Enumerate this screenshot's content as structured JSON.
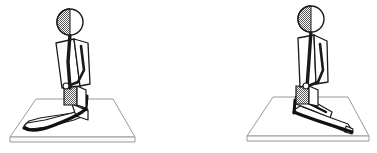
{
  "figure": {
    "background_color": "#ffffff",
    "ink_color": "#1a1a1a",
    "platform_line_color": "#808080",
    "shade_color": "#7a7a7a",
    "width": 377,
    "height": 153,
    "artifacts": {
      "top_text": "",
      "bottom_text": ""
    },
    "panels": [
      {
        "id": "left-figure",
        "label": "Kneeling figure, legs folded to the left",
        "head": {
          "cx": 70,
          "cy": 22,
          "r": 13,
          "shaded_half": "left"
        },
        "pelvis": {
          "x": 64,
          "y": 86,
          "w": 13,
          "h": 19,
          "shaded": true
        },
        "platform": {
          "corners": "back-left, back-right, front-right, front-left",
          "thickness": 5
        }
      },
      {
        "id": "right-figure",
        "label": "Kneeling figure, legs folded to the right",
        "head": {
          "cx": 311,
          "cy": 19,
          "r": 13,
          "shaded_half": "left"
        },
        "pelvis": {
          "x": 296,
          "y": 86,
          "w": 13,
          "h": 18,
          "shaded": true
        },
        "platform": {
          "corners": "back-left, back-right, front-right, front-left",
          "thickness": 5
        }
      }
    ]
  }
}
